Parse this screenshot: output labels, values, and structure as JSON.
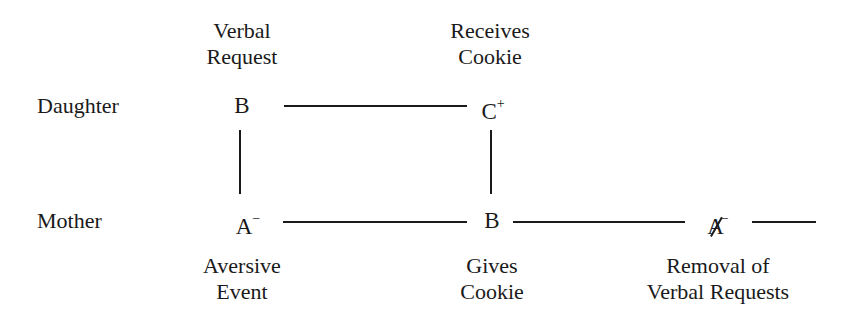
{
  "diagram": {
    "rows": [
      {
        "id": "daughter",
        "label": "Daughter"
      },
      {
        "id": "mother",
        "label": "Mother"
      }
    ],
    "nodes": {
      "daughter_b": {
        "symbol": "B",
        "superscript": "",
        "caption_top": [
          "Verbal",
          "Request"
        ]
      },
      "daughter_c": {
        "symbol": "C",
        "superscript": "+",
        "caption_top": [
          "Receives",
          "Cookie"
        ]
      },
      "mother_a": {
        "symbol": "A",
        "superscript": "−",
        "caption_bottom": [
          "Aversive",
          "Event"
        ]
      },
      "mother_b": {
        "symbol": "B",
        "superscript": "",
        "caption_bottom": [
          "Gives",
          "Cookie"
        ]
      },
      "mother_a_removed": {
        "symbol": "A",
        "superscript": "−",
        "struck_through": true,
        "caption_bottom": [
          "Removal of",
          "Verbal Requests"
        ]
      }
    },
    "edges": [
      {
        "from": "daughter_b",
        "to": "daughter_c",
        "orientation": "horizontal"
      },
      {
        "from": "daughter_b",
        "to": "mother_a",
        "orientation": "vertical"
      },
      {
        "from": "daughter_c",
        "to": "mother_b",
        "orientation": "vertical"
      },
      {
        "from": "mother_a",
        "to": "mother_b",
        "orientation": "horizontal"
      },
      {
        "from": "mother_b",
        "to": "mother_a_removed",
        "orientation": "horizontal"
      },
      {
        "from": "mother_a_removed",
        "to": "continuation",
        "orientation": "horizontal"
      }
    ]
  }
}
